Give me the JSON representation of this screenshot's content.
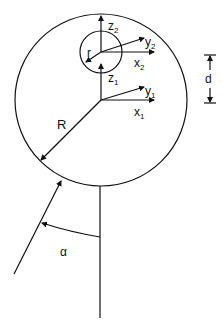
{
  "diagram": {
    "labels": {
      "z2": "z",
      "z2_sub": "2",
      "y2": "y",
      "y2_sub": "2",
      "x2": "x",
      "x2_sub": "2",
      "z1": "z",
      "z1_sub": "1",
      "y1": "y",
      "y1_sub": "1",
      "x1": "x",
      "x1_sub": "1",
      "r": "r",
      "R": "R",
      "d": "d",
      "alpha": "α"
    },
    "colors": {
      "stroke": "#111111",
      "background": "#ffffff"
    }
  }
}
